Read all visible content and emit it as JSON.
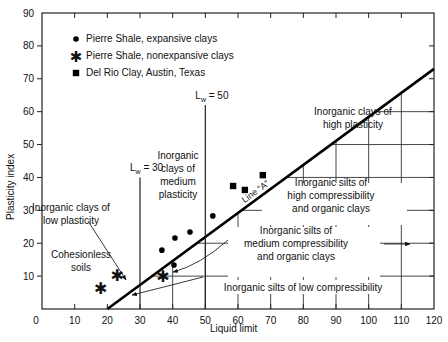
{
  "chart_data": {
    "type": "scatter",
    "title": "",
    "xlabel": "Liquid limit",
    "ylabel": "Plasticity index",
    "xlim": [
      0,
      120
    ],
    "ylim": [
      0,
      90
    ],
    "x_ticks": [
      0,
      10,
      20,
      30,
      40,
      50,
      60,
      70,
      80,
      90,
      100,
      110,
      120
    ],
    "y_ticks": [
      0,
      10,
      20,
      30,
      40,
      50,
      60,
      70,
      80,
      90
    ],
    "grid": false,
    "legend_position": "upper-left",
    "series": [
      {
        "name": "Pierre Shale, expansive clays",
        "marker": "circle",
        "points": [
          [
            36.7,
            17.9
          ],
          [
            40.4,
            13.4
          ],
          [
            40.7,
            21.6
          ],
          [
            45.3,
            23.4
          ],
          [
            52.3,
            28.3
          ]
        ]
      },
      {
        "name": "Pierre Shale, nonexpansive clays",
        "marker": "asterisk",
        "points": [
          [
            18.0,
            6.4
          ],
          [
            23.0,
            10.3
          ],
          [
            37.0,
            10.0
          ]
        ]
      },
      {
        "name": "Del Rio Clay, Austin, Texas",
        "marker": "square",
        "points": [
          [
            58.5,
            37.4
          ],
          [
            62.1,
            36.2
          ],
          [
            67.6,
            40.7
          ]
        ]
      }
    ],
    "reference_lines": [
      {
        "name": "Line \"A\"",
        "label": "Line “A”",
        "equation": "PI = 0.73 (LL - 20)",
        "from": [
          20,
          0
        ],
        "to": [
          120,
          73
        ]
      },
      {
        "name": "Lw = 30",
        "label_main": "L",
        "label_sub": "w",
        "label_rest": " = 30",
        "x": 30
      },
      {
        "name": "Lw = 50",
        "label_main": "L",
        "label_sub": "w",
        "label_rest": " = 50",
        "x": 50
      }
    ],
    "annotations": [
      {
        "id": "high_plasticity",
        "lines": [
          "Inorganic clays of",
          "high plasticity"
        ]
      },
      {
        "id": "medium_plasticity",
        "lines": [
          "Inorganic",
          "clays of",
          "medium",
          "plasticity"
        ]
      },
      {
        "id": "low_plasticity",
        "lines": [
          "Inorganic clays of",
          "low plasticity"
        ]
      },
      {
        "id": "cohesionless",
        "lines": [
          "Cohesionless",
          "soils"
        ]
      },
      {
        "id": "silts_high",
        "lines": [
          "Inorganic silts of",
          "high compressibility",
          "and organic clays"
        ]
      },
      {
        "id": "silts_medium",
        "lines": [
          "Inorganic silts of",
          "medium compressibility",
          "and organic clays"
        ]
      },
      {
        "id": "silts_low",
        "lines": [
          "Inorganic silts of low compressibility"
        ]
      }
    ]
  },
  "labels": {
    "x_axis": "Liquid limit",
    "y_axis": "Plasticity index",
    "legend": [
      "Pierre Shale, expansive clays",
      "Pierre Shale, nonexpansive clays",
      "Del Rio Clay, Austin, Texas"
    ]
  }
}
